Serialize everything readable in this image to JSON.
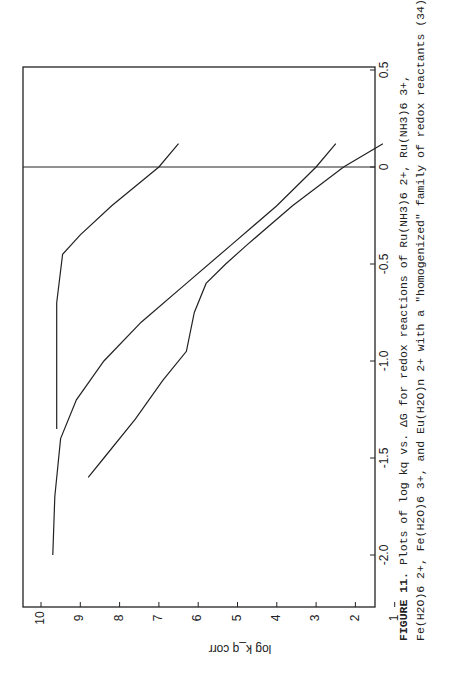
{
  "figure": {
    "caption_label": "FIGURE 11.",
    "caption_line1": "Plots of log kq vs. ΔG for redox reactions of Ru(NH3)6 2+, Ru(NH3)6 3+,",
    "caption_line2": "Fe(H2O)6 2+, Fe(H2O)6 3+, and Eu(H2O)n 2+ with a \"homogenized\" family of redox reactants (34)."
  },
  "chart_data": {
    "type": "scatter",
    "orientation": "rotated 90° counter-clockwise on page",
    "title": "",
    "xlabel": "ΔG",
    "ylabel": "log k_q corr",
    "xlim": [
      -2.1,
      0.5
    ],
    "ylim": [
      1,
      10.5
    ],
    "xticks": [
      -2.0,
      -1.5,
      -1.0,
      -0.5,
      0,
      0.5
    ],
    "xtick_labels": [
      "-2.0",
      "-1.5",
      "-1.0",
      "-0.5",
      "0",
      "0.5"
    ],
    "yticks": [
      1,
      2,
      3,
      4,
      5,
      6,
      7,
      8,
      9,
      10
    ],
    "ytick_labels": [
      "1",
      "2",
      "3",
      "4",
      "5",
      "6",
      "7",
      "8",
      "9",
      "10"
    ],
    "grid": false,
    "reference_line": {
      "x": 0
    },
    "annotations": [
      {
        "text": "Ru(NH3)6 n+",
        "x": -0.35,
        "y": 9.1
      },
      {
        "text": "Fe(H2O)6 n+",
        "x": -0.6,
        "y": 7.6
      },
      {
        "text": "Eu(H2O)n 2+",
        "x": -1.2,
        "y": 6.9
      }
    ],
    "series": [
      {
        "name": "Ru(NH3)6 n+ (filled)",
        "marker": "filled-triangle",
        "points": [
          [
            0.01,
            6.97
          ],
          [
            -0.24,
            8.5
          ],
          [
            -0.62,
            8.6
          ],
          [
            -0.75,
            9.6
          ],
          [
            -1.17,
            9.6
          ]
        ]
      },
      {
        "name": "Ru(NH3)6 n+ (open)",
        "marker": "open-triangle",
        "points": [
          [
            -0.85,
            9.75
          ],
          [
            -0.87,
            9.5
          ],
          [
            -1.33,
            9.6
          ]
        ]
      },
      {
        "name": "Fe(H2O)6 n+ (filled)",
        "marker": "filled-circle",
        "points": [
          [
            0.01,
            3.0
          ],
          [
            -0.06,
            4.2
          ],
          [
            -0.08,
            4.0
          ],
          [
            -0.2,
            3.8
          ],
          [
            -0.2,
            4.5
          ],
          [
            -0.25,
            4.9
          ],
          [
            -0.27,
            4.5
          ],
          [
            -0.3,
            4.7
          ],
          [
            -0.33,
            5.2
          ],
          [
            -0.35,
            5.1
          ],
          [
            -0.36,
            4.8
          ],
          [
            -0.35,
            5.3
          ],
          [
            -0.4,
            5.6
          ],
          [
            -0.45,
            5.5
          ],
          [
            -0.5,
            6.0
          ],
          [
            -0.48,
            5.8
          ],
          [
            -0.5,
            6.4
          ],
          [
            -0.52,
            6.6
          ],
          [
            -0.52,
            5.9
          ],
          [
            -0.55,
            6.1
          ],
          [
            -0.56,
            6.5
          ],
          [
            -0.58,
            6.8
          ],
          [
            -0.65,
            7.0
          ],
          [
            -0.68,
            6.4
          ],
          [
            -0.69,
            6.6
          ],
          [
            -0.6,
            7.2
          ],
          [
            -0.71,
            7.5
          ],
          [
            -0.75,
            7.6
          ]
        ]
      },
      {
        "name": "Fe(H2O)6 n+ (open)",
        "marker": "open-circle",
        "points": [
          [
            -0.22,
            5.4
          ],
          [
            -0.35,
            6.8
          ],
          [
            -0.38,
            6.8
          ],
          [
            -0.42,
            7.2
          ],
          [
            -0.65,
            8.2
          ],
          [
            -0.95,
            9.2
          ],
          [
            -1.08,
            9.15
          ],
          [
            -1.12,
            9.2
          ],
          [
            -1.18,
            9.25
          ],
          [
            -1.23,
            9.45
          ],
          [
            -1.4,
            9.35
          ],
          [
            -1.45,
            9.35
          ],
          [
            -1.55,
            9.5
          ],
          [
            -1.6,
            9.5
          ],
          [
            -1.62,
            9.55
          ],
          [
            -1.65,
            9.5
          ],
          [
            -1.68,
            9.3
          ],
          [
            -1.7,
            9.7
          ],
          [
            -1.75,
            9.8
          ],
          [
            -1.8,
            9.55
          ]
        ]
      },
      {
        "name": "Eu(H2O)n 2+",
        "marker": "filled-square",
        "points": [
          [
            0.07,
            1.55
          ],
          [
            -0.18,
            4.3
          ],
          [
            -0.45,
            5.55
          ],
          [
            -0.72,
            6.0
          ],
          [
            -0.78,
            5.3
          ],
          [
            -1.05,
            6.1
          ],
          [
            -1.1,
            7.0
          ],
          [
            -1.15,
            7.0
          ],
          [
            -1.2,
            6.9
          ],
          [
            -1.18,
            7.6
          ],
          [
            -1.25,
            7.3
          ],
          [
            -1.38,
            7.9
          ],
          [
            -1.47,
            8.5
          ]
        ]
      }
    ],
    "fit_curves": [
      {
        "name": "Ru(NH3)6 n+",
        "points": [
          [
            0.12,
            6.5
          ],
          [
            0.0,
            7.0
          ],
          [
            -0.2,
            8.2
          ],
          [
            -0.35,
            9.0
          ],
          [
            -0.45,
            9.45
          ],
          [
            -0.7,
            9.6
          ],
          [
            -1.35,
            9.6
          ]
        ]
      },
      {
        "name": "Fe(H2O)6 n+",
        "points": [
          [
            0.12,
            2.5
          ],
          [
            0.0,
            3.0
          ],
          [
            -0.2,
            4.0
          ],
          [
            -0.4,
            5.15
          ],
          [
            -0.6,
            6.3
          ],
          [
            -0.8,
            7.45
          ],
          [
            -1.0,
            8.4
          ],
          [
            -1.2,
            9.1
          ],
          [
            -1.4,
            9.5
          ],
          [
            -1.7,
            9.65
          ],
          [
            -2.0,
            9.7
          ]
        ]
      },
      {
        "name": "Eu(H2O)n 2+",
        "points": [
          [
            0.12,
            1.3
          ],
          [
            0.0,
            2.3
          ],
          [
            -0.2,
            3.6
          ],
          [
            -0.4,
            4.75
          ],
          [
            -0.5,
            5.3
          ],
          [
            -0.6,
            5.8
          ],
          [
            -0.75,
            6.1
          ],
          [
            -0.95,
            6.3
          ],
          [
            -1.1,
            6.9
          ],
          [
            -1.3,
            7.6
          ],
          [
            -1.5,
            8.4
          ],
          [
            -1.6,
            8.8
          ]
        ]
      }
    ]
  }
}
